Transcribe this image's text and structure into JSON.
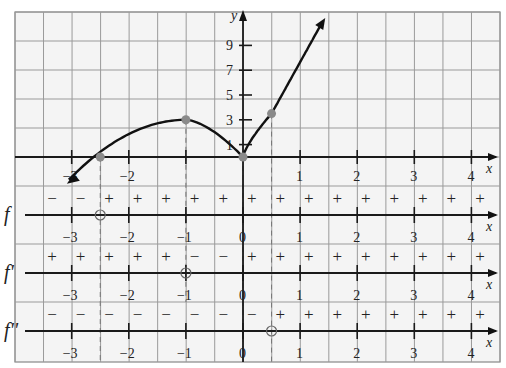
{
  "chart_data": {
    "type": "line",
    "title": "",
    "xlabel": "x",
    "ylabel": "y",
    "xlim": [
      -3.5,
      4.5
    ],
    "ylim_main": [
      -1,
      11
    ],
    "grid": true,
    "x_ticks": [
      -3,
      -2,
      -1,
      0,
      1,
      2,
      3,
      4
    ],
    "y_ticks": [
      1,
      3,
      5,
      7,
      9
    ],
    "series": [
      {
        "name": "f",
        "description": "Curve rising from lower-left, crosses x-axis near x=-2.5, local max (−1, 3), cusp minimum (0, 0), then rises steeply through (0.5, 3.5)",
        "points": [
          [
            -3,
            -1.7
          ],
          [
            -2.5,
            0
          ],
          [
            -2,
            1.6
          ],
          [
            -1.5,
            2.7
          ],
          [
            -1,
            3
          ],
          [
            -0.5,
            2.3
          ],
          [
            0,
            0
          ],
          [
            0.5,
            3.5
          ],
          [
            1.4,
            11
          ]
        ],
        "marked_points": [
          [
            -2.5,
            0
          ],
          [
            -1,
            3
          ],
          [
            0,
            0
          ],
          [
            0.5,
            3.5
          ]
        ]
      }
    ],
    "sign_charts": [
      {
        "name": "f",
        "label": "f",
        "intervals": [
          "−",
          "−",
          "+",
          "+",
          "+",
          "+",
          "+",
          "+",
          "+",
          "+",
          "+",
          "+",
          "+",
          "+",
          "+",
          "+"
        ],
        "zero_at": -2.5,
        "tick_labels": [
          "−3",
          "−2",
          "−1",
          "0",
          "1",
          "2",
          "3",
          "4"
        ]
      },
      {
        "name": "f_prime",
        "label": "f'",
        "intervals": [
          "+",
          "+",
          "+",
          "+",
          "+",
          "−",
          "−",
          "+",
          "+",
          "+",
          "+",
          "+",
          "+",
          "+",
          "+",
          "+"
        ],
        "zero_at": -1,
        "tick_labels": [
          "−3",
          "−2",
          "−1",
          "0",
          "1",
          "2",
          "3",
          "4"
        ]
      },
      {
        "name": "f_double_prime",
        "label": "f''",
        "intervals": [
          "−",
          "−",
          "−",
          "−",
          "−",
          "−",
          "−",
          "−",
          "+",
          "+",
          "+",
          "+",
          "+",
          "+",
          "+",
          "+"
        ],
        "zero_at": 0.5,
        "tick_labels": [
          "−3",
          "−2",
          "−1",
          "0",
          "1",
          "2",
          "3",
          "4"
        ]
      }
    ]
  },
  "labels": {
    "x_axis": "x",
    "y_axis": "y",
    "y_ticks": [
      "1",
      "3",
      "5",
      "7",
      "9"
    ],
    "x_ticks_main": [
      "−3",
      "−2",
      "1",
      "2",
      "3",
      "4"
    ],
    "row_f": "f",
    "row_fp": "f'",
    "row_fpp": "f''"
  }
}
